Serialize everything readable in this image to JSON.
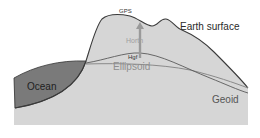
{
  "diagram": {
    "labels": {
      "gps": "GPS",
      "earth_surface": "Earth surface",
      "ocean": "Ocean",
      "ellipsoid": "Ellipsoid",
      "geoid": "Geoid",
      "orthometric_height": "Horth",
      "geoid_height": "Hgf"
    },
    "colors": {
      "ground": "#d6d6d6",
      "ocean": "#7a7a7a",
      "outline": "#3a3a3a",
      "geoid_line": "#5a5a5a",
      "ellipsoid_line": "#8a8a8a",
      "arrow": "#9a9a9a"
    }
  }
}
